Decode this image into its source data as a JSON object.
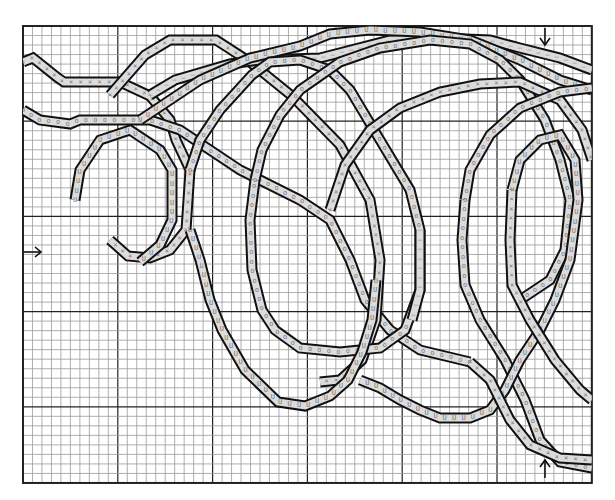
{
  "diagram": {
    "type": "knitting-cable-chart",
    "grid": {
      "left": 23,
      "top": 26,
      "cols": 60,
      "rows": 48,
      "cell_w": 9.48,
      "cell_h": 9.52,
      "major_every": 10,
      "minor_color": "#9a9a9a",
      "major_color": "#222222",
      "border_color": "#222222"
    },
    "band_fill": "#dcdcdc",
    "line_color": "#111111",
    "legend_symbols": [
      "X",
      "O",
      "U",
      "-"
    ],
    "arrows": [
      {
        "name": "left-start-arrow",
        "direction": "right",
        "x": 24,
        "y": 252
      },
      {
        "name": "top-marker-arrow",
        "direction": "down",
        "x": 545,
        "y": 28
      },
      {
        "name": "bottom-marker-arrow",
        "direction": "up",
        "x": 545,
        "y": 478
      }
    ],
    "cables": [
      {
        "id": "c1",
        "symbol": "X",
        "path": [
          [
            23,
            62
          ],
          [
            33,
            58
          ],
          [
            58,
            78
          ],
          [
            64,
            82
          ],
          [
            120,
            82
          ],
          [
            150,
            96
          ],
          [
            170,
            120
          ],
          [
            176,
            140
          ],
          [
            190,
            170
          ],
          [
            186,
            230
          ],
          [
            170,
            250
          ],
          [
            150,
            258
          ],
          [
            128,
            256
          ],
          [
            110,
            240
          ]
        ]
      },
      {
        "id": "c2",
        "symbol": "O",
        "path": [
          [
            23,
            110
          ],
          [
            40,
            120
          ],
          [
            70,
            124
          ],
          [
            80,
            120
          ],
          [
            150,
            120
          ],
          [
            180,
            130
          ],
          [
            240,
            170
          ],
          [
            300,
            200
          ],
          [
            330,
            220
          ],
          [
            350,
            260
          ],
          [
            365,
            300
          ],
          [
            390,
            330
          ],
          [
            420,
            350
          ],
          [
            470,
            362
          ]
        ]
      },
      {
        "id": "c3",
        "symbol": "U",
        "path": [
          [
            75,
            200
          ],
          [
            80,
            170
          ],
          [
            100,
            140
          ],
          [
            130,
            130
          ],
          [
            160,
            150
          ],
          [
            172,
            170
          ],
          [
            172,
            220
          ],
          [
            160,
            245
          ],
          [
            140,
            262
          ]
        ]
      },
      {
        "id": "c4",
        "symbol": "X",
        "path": [
          [
            110,
            95
          ],
          [
            145,
            55
          ],
          [
            170,
            40
          ],
          [
            216,
            40
          ],
          [
            250,
            62
          ],
          [
            292,
            96
          ],
          [
            340,
            145
          ],
          [
            370,
            200
          ],
          [
            380,
            260
          ],
          [
            376,
            320
          ],
          [
            362,
            360
          ],
          [
            340,
            380
          ],
          [
            320,
            382
          ]
        ]
      },
      {
        "id": "c5",
        "symbol": "-",
        "path": [
          [
            150,
            95
          ],
          [
            175,
            80
          ],
          [
            230,
            64
          ],
          [
            260,
            60
          ],
          [
            320,
            58
          ],
          [
            390,
            40
          ],
          [
            440,
            38
          ],
          [
            490,
            40
          ],
          [
            520,
            48
          ],
          [
            560,
            58
          ],
          [
            592,
            70
          ]
        ]
      },
      {
        "id": "c6",
        "symbol": "U",
        "path": [
          [
            140,
            120
          ],
          [
            170,
            100
          ],
          [
            200,
            80
          ],
          [
            250,
            58
          ],
          [
            300,
            46
          ],
          [
            330,
            34
          ],
          [
            370,
            30
          ],
          [
            420,
            32
          ],
          [
            470,
            40
          ],
          [
            520,
            60
          ],
          [
            560,
            80
          ],
          [
            592,
            90
          ]
        ]
      },
      {
        "id": "c7",
        "symbol": "O",
        "path": [
          [
            190,
            170
          ],
          [
            200,
            140
          ],
          [
            220,
            110
          ],
          [
            252,
            75
          ],
          [
            270,
            62
          ],
          [
            300,
            60
          ],
          [
            330,
            70
          ],
          [
            350,
            90
          ],
          [
            380,
            140
          ],
          [
            410,
            190
          ],
          [
            420,
            230
          ],
          [
            420,
            290
          ],
          [
            405,
            330
          ],
          [
            380,
            348
          ],
          [
            340,
            352
          ],
          [
            300,
            348
          ],
          [
            275,
            330
          ],
          [
            262,
            310
          ],
          [
            252,
            270
          ],
          [
            250,
            220
          ],
          [
            255,
            180
          ]
        ]
      },
      {
        "id": "c8",
        "symbol": "U",
        "path": [
          [
            190,
            230
          ],
          [
            200,
            260
          ],
          [
            210,
            300
          ],
          [
            222,
            330
          ],
          [
            245,
            370
          ],
          [
            278,
            402
          ],
          [
            305,
            406
          ],
          [
            330,
            396
          ],
          [
            348,
            380
          ],
          [
            362,
            352
          ],
          [
            372,
            320
          ],
          [
            376,
            280
          ]
        ]
      },
      {
        "id": "c9",
        "symbol": "O",
        "path": [
          [
            255,
            180
          ],
          [
            262,
            150
          ],
          [
            280,
            115
          ],
          [
            300,
            90
          ],
          [
            340,
            62
          ],
          [
            380,
            48
          ],
          [
            430,
            40
          ],
          [
            470,
            44
          ],
          [
            500,
            60
          ],
          [
            520,
            80
          ],
          [
            545,
            120
          ],
          [
            560,
            160
          ],
          [
            570,
            200
          ],
          [
            565,
            250
          ],
          [
            550,
            280
          ],
          [
            520,
            300
          ]
        ]
      },
      {
        "id": "c10",
        "symbol": "X",
        "path": [
          [
            330,
            210
          ],
          [
            345,
            165
          ],
          [
            370,
            130
          ],
          [
            400,
            108
          ],
          [
            440,
            92
          ],
          [
            480,
            84
          ],
          [
            520,
            82
          ],
          [
            560,
            100
          ],
          [
            582,
            130
          ],
          [
            592,
            160
          ]
        ]
      },
      {
        "id": "c11",
        "symbol": "O",
        "path": [
          [
            465,
            200
          ],
          [
            470,
            170
          ],
          [
            490,
            135
          ],
          [
            520,
            108
          ],
          [
            560,
            92
          ],
          [
            592,
            88
          ]
        ]
      },
      {
        "id": "c12",
        "symbol": "O",
        "path": [
          [
            465,
            200
          ],
          [
            462,
            240
          ],
          [
            465,
            285
          ],
          [
            480,
            320
          ],
          [
            505,
            360
          ],
          [
            525,
            400
          ],
          [
            540,
            440
          ],
          [
            560,
            462
          ],
          [
            592,
            468
          ]
        ]
      },
      {
        "id": "c13",
        "symbol": "U",
        "path": [
          [
            512,
            190
          ],
          [
            520,
            160
          ],
          [
            540,
            140
          ],
          [
            560,
            135
          ],
          [
            575,
            160
          ],
          [
            578,
            200
          ],
          [
            570,
            260
          ],
          [
            555,
            300
          ],
          [
            540,
            330
          ],
          [
            520,
            360
          ],
          [
            505,
            390
          ],
          [
            490,
            410
          ],
          [
            470,
            418
          ],
          [
            440,
            418
          ],
          [
            420,
            410
          ],
          [
            400,
            400
          ],
          [
            380,
            388
          ],
          [
            360,
            380
          ]
        ]
      },
      {
        "id": "c14",
        "symbol": "X",
        "path": [
          [
            512,
            190
          ],
          [
            510,
            240
          ],
          [
            512,
            285
          ],
          [
            530,
            320
          ],
          [
            555,
            360
          ],
          [
            580,
            390
          ],
          [
            592,
            400
          ]
        ]
      },
      {
        "id": "c15",
        "symbol": "-",
        "path": [
          [
            420,
            230
          ],
          [
            420,
            290
          ],
          [
            412,
            320
          ]
        ]
      },
      {
        "id": "c16",
        "symbol": "X",
        "path": [
          [
            470,
            362
          ],
          [
            490,
            380
          ],
          [
            510,
            420
          ],
          [
            530,
            445
          ],
          [
            560,
            458
          ],
          [
            592,
            460
          ]
        ]
      }
    ]
  }
}
